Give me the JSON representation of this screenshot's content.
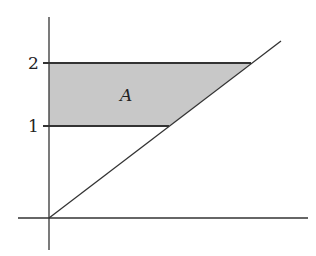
{
  "diagram": {
    "title": "",
    "region_label": "A",
    "y_ticks": [
      {
        "value": 2,
        "label": "2"
      },
      {
        "value": 1,
        "label": "1"
      }
    ],
    "lines": [
      {
        "name": "y = 2",
        "type": "horizontal"
      },
      {
        "name": "y = 1",
        "type": "horizontal"
      },
      {
        "name": "diagonal through origin",
        "type": "line"
      }
    ],
    "colors": {
      "axis": "#333333",
      "region_fill": "#c8c8c8",
      "region_edge": "#333333"
    }
  }
}
